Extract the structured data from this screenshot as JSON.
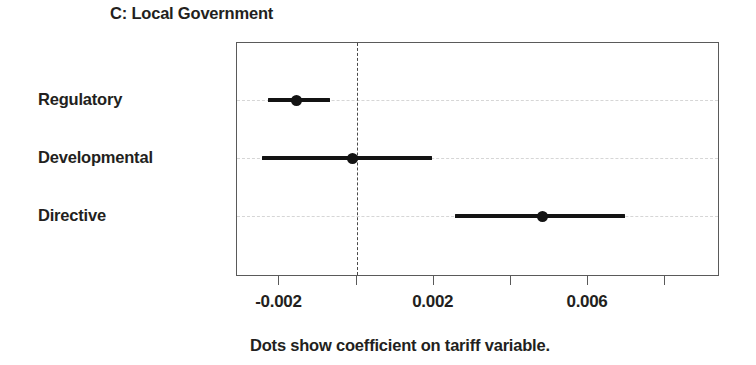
{
  "chart_data": {
    "type": "scatter",
    "title": "C: Local Government",
    "caption": "Dots show coefficient on tariff variable.",
    "xlabel": "",
    "ylabel": "",
    "xlim": [
      -0.0031,
      0.00937
    ],
    "grid": true,
    "legend": "none",
    "zero_reference_line": 0,
    "categories": [
      "Regulatory",
      "Developmental",
      "Directive"
    ],
    "tick_values": [
      -0.002,
      0.0,
      0.002,
      0.004,
      0.006,
      0.008
    ],
    "tick_labels": [
      "-0.002",
      "",
      "0.002",
      "",
      "0.006",
      ""
    ],
    "points": [
      {
        "category": "Regulatory",
        "coefficient": -0.00155,
        "ci_low": -0.0023,
        "ci_high": -0.0007
      },
      {
        "category": "Developmental",
        "coefficient": -0.0001,
        "ci_low": -0.00245,
        "ci_high": 0.00196
      },
      {
        "category": "Directive",
        "coefficient": 0.00483,
        "ci_low": 0.00255,
        "ci_high": 0.00697
      }
    ]
  },
  "colors": {
    "marker": "#131313",
    "frame": "#5a5a5a",
    "gridline": "#d6d6d6",
    "zero_line": "#4a4a4a",
    "text": "#231f20",
    "background": "#ffffff"
  }
}
